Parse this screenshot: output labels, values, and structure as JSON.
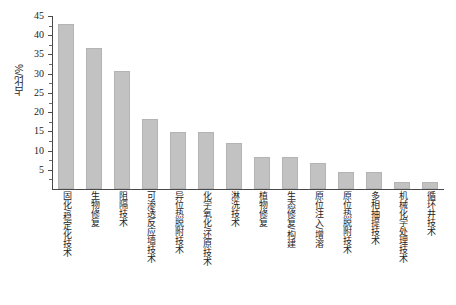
{
  "chart_data": {
    "type": "bar",
    "title": "",
    "xlabel": "",
    "ylabel": "占比/%",
    "ylim": [
      0,
      45
    ],
    "y_ticks": [
      5,
      10,
      15,
      20,
      25,
      30,
      35,
      40,
      45
    ],
    "grid": false,
    "legend": null,
    "bar_color": "#c2c2c2",
    "categories": [
      "固化/稳定化技术",
      "生物修复",
      "阻隔技术",
      "可渗透反应墙技术",
      "异位热脱附技术",
      "化学氧化/还原技术",
      "淋洗技术",
      "植物修复",
      "生态修复/构建",
      "原位注入/增溶",
      "原位热脱附技术",
      "多相抽提技术",
      "机械化学处理技术",
      "循环井技术"
    ],
    "values": [
      43.0,
      36.7,
      30.6,
      18.3,
      14.8,
      14.8,
      12.0,
      8.2,
      8.2,
      6.7,
      4.3,
      4.3,
      1.9,
      1.9
    ]
  },
  "axis": {
    "y_tick_labels": [
      "45",
      "40",
      "35",
      "30",
      "25",
      "20",
      "15",
      "10",
      "5"
    ],
    "y_axis_title": "占比/%"
  }
}
